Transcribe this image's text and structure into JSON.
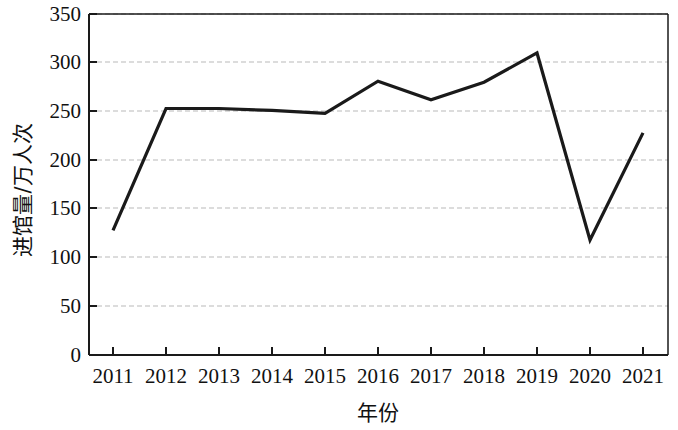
{
  "chart_data": {
    "type": "line",
    "title": "",
    "xlabel": "年份",
    "ylabel": "进馆量/万人次",
    "categories": [
      "2011",
      "2012",
      "2013",
      "2014",
      "2015",
      "2016",
      "2017",
      "2018",
      "2019",
      "2020",
      "2021"
    ],
    "values": [
      128,
      253,
      253,
      251,
      248,
      281,
      262,
      280,
      310,
      118,
      228
    ],
    "series": [
      {
        "name": "进馆量",
        "values": [
          128,
          253,
          253,
          251,
          248,
          281,
          262,
          280,
          310,
          118,
          228
        ]
      }
    ],
    "xlim": [
      "2011",
      "2021"
    ],
    "ylim": [
      0,
      350
    ],
    "yticks": [
      0,
      50,
      100,
      150,
      200,
      250,
      300,
      350
    ],
    "ytick_labels": [
      "0",
      "50",
      "100",
      "150",
      "200",
      "250",
      "300",
      "350"
    ],
    "xtick_labels": [
      "2011",
      "2012",
      "2013",
      "2014",
      "2015",
      "2016",
      "2017",
      "2018",
      "2019",
      "2020",
      "2021"
    ],
    "grid": "horizontal-dashed",
    "legend": "none",
    "line_color": "#1a1a1a",
    "grid_color": "#b9b9b9",
    "axis_color": "#1a1a1a",
    "background_color": "#ffffff"
  }
}
